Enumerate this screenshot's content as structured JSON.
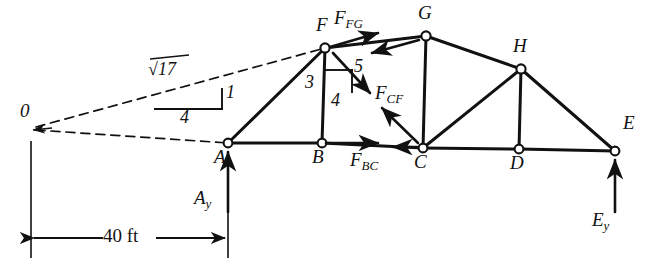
{
  "figure": {
    "type": "truss-free-body-diagram"
  },
  "nodes": [
    {
      "id": "A",
      "label": "A",
      "x": 228,
      "y": 143,
      "label_x": 216,
      "label_y": 150
    },
    {
      "id": "B",
      "label": "B",
      "x": 322,
      "y": 143,
      "label_x": 315,
      "label_y": 150
    },
    {
      "id": "C",
      "label": "C",
      "x": 423,
      "y": 148,
      "label_x": 416,
      "label_y": 155
    },
    {
      "id": "D",
      "label": "D",
      "x": 519,
      "y": 149,
      "label_x": 512,
      "label_y": 156
    },
    {
      "id": "E",
      "label": "E",
      "x": 615,
      "y": 151,
      "label_x": 624,
      "label_y": 120
    },
    {
      "id": "F",
      "label": "F",
      "x": 325,
      "y": 48,
      "label_x": 318,
      "label_y": 18
    },
    {
      "id": "G",
      "label": "G",
      "x": 426,
      "y": 36,
      "label_x": 420,
      "label_y": 5
    },
    {
      "id": "H",
      "label": "H",
      "x": 521,
      "y": 69,
      "label_x": 515,
      "label_y": 38
    },
    {
      "id": "O",
      "label": "0",
      "x": 31,
      "y": 126,
      "label_x": 20,
      "label_y": 110
    }
  ],
  "members": [
    {
      "from": "A",
      "to": "B"
    },
    {
      "from": "B",
      "to": "C"
    },
    {
      "from": "C",
      "to": "D"
    },
    {
      "from": "D",
      "to": "E"
    },
    {
      "from": "A",
      "to": "F"
    },
    {
      "from": "F",
      "to": "B"
    },
    {
      "from": "F",
      "to": "G"
    },
    {
      "from": "G",
      "to": "C"
    },
    {
      "from": "G",
      "to": "H"
    },
    {
      "from": "C",
      "to": "H"
    },
    {
      "from": "H",
      "to": "D"
    },
    {
      "from": "H",
      "to": "E"
    }
  ],
  "forces": [
    {
      "id": "F_FG_at_F",
      "label": "F",
      "sub": "FG",
      "label_x": 336,
      "label_y": 10
    },
    {
      "id": "F_CF",
      "label": "F",
      "sub": "CF",
      "label_x": 378,
      "label_y": 85
    },
    {
      "id": "F_BC",
      "label": "F",
      "sub": "BC",
      "label_x": 352,
      "label_y": 152
    },
    {
      "id": "A_y",
      "label": "A",
      "sub": "y",
      "label_x": 196,
      "label_y": 190
    },
    {
      "id": "E_y",
      "label": "E",
      "sub": "y",
      "label_x": 594,
      "label_y": 212
    }
  ],
  "slope_triangles": [
    {
      "id": "line-of-action-slope",
      "hypotenuse_label": "√17",
      "rise_label": "1",
      "run_label": "4",
      "hyp_x": 150,
      "hyp_y": 65,
      "rise_x": 225,
      "rise_y": 85,
      "run_x": 182,
      "run_y": 110
    },
    {
      "id": "member-cf-slope",
      "hypotenuse_label": "5",
      "rise_label": "3",
      "run_label": "4",
      "hyp_x": 356,
      "hyp_y": 63,
      "rise_x": 307,
      "rise_y": 77,
      "run_x": 333,
      "run_y": 95
    }
  ],
  "dimension": {
    "label": "40 ft",
    "label_x": 105,
    "label_y": 228,
    "from_x": 31,
    "to_x": 228,
    "y": 238
  },
  "colors": {
    "ink": "#111111",
    "background": "#ffffff"
  }
}
